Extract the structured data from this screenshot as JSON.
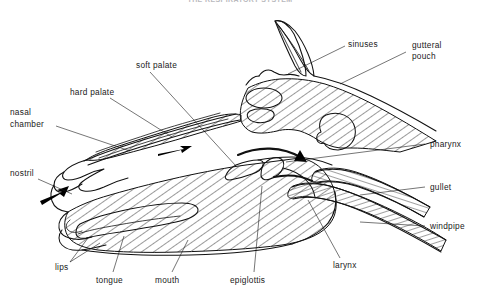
{
  "figure": {
    "title": "THE RESPIRATORY SYSTEM",
    "title_visible": false,
    "background_color": "#ffffff",
    "ink_color": "#111111",
    "width": 480,
    "height": 303
  },
  "labels": {
    "sinuses": "sinuses",
    "gutteral_pouch_line1": "gutteral",
    "gutteral_pouch_line2": "pouch",
    "soft_palate": "soft palate",
    "hard_palate": "hard palate",
    "nasal_chamber_line1": "nasal",
    "nasal_chamber_line2": "chamber",
    "nostril": "nostril",
    "pharynx": "pharynx",
    "gullet": "gullet",
    "windpipe": "windpipe",
    "lips": "lips",
    "tongue": "tongue",
    "mouth": "mouth",
    "epiglottis": "epiglottis",
    "larynx": "larynx"
  },
  "annotations": {
    "airflow_nostril": "inhaled-air-arrow-at-nostril",
    "airflow_pharynx": "air-arrow-through-nasal-chamber",
    "airflow_larynx": "air-arrow-into-larynx"
  }
}
